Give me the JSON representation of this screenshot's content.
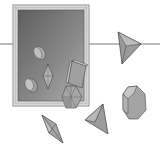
{
  "diagram": {
    "title": "",
    "colors": {
      "background": "#ffffff",
      "frame_outer": "#a8a8a8",
      "frame_inner": "#e8e8e8",
      "window_dark": "#6a6a6a",
      "window_light": "#a0a0a0",
      "solid_fill": "#9a9a9a",
      "solid_light": "#bdbdbd",
      "solid_dark": "#7a7a7a",
      "edge": "#555555",
      "horizon_line": "#777777"
    },
    "shapes": [
      {
        "name": "cylinder-upper",
        "location": "inside-frame"
      },
      {
        "name": "bipyramid-small",
        "location": "inside-frame"
      },
      {
        "name": "cylinder-lower",
        "location": "inside-frame"
      },
      {
        "name": "rectangular-prism",
        "location": "frame-edge"
      },
      {
        "name": "hexagonal-prism",
        "location": "frame-edge"
      },
      {
        "name": "tetrahedron-top",
        "location": "right"
      },
      {
        "name": "octagonal-prism",
        "location": "right"
      },
      {
        "name": "tetrahedron-bottom",
        "location": "bottom"
      },
      {
        "name": "bipyramid-large",
        "location": "bottom-left"
      }
    ]
  }
}
